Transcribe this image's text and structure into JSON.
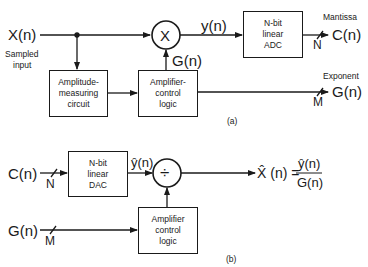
{
  "diagram_a": {
    "caption": "(a)",
    "input_label": "X(n)",
    "input_desc": [
      "Sampled",
      "input"
    ],
    "multiplier_symbol": "X",
    "y_label": "y(n)",
    "gain_label": "G(n)",
    "amplitude_box": [
      "Amplitude-",
      "measuring",
      "circuit"
    ],
    "amp_control_box": [
      "Amplifier-",
      "control",
      "logic"
    ],
    "adc_box": [
      "N-bit",
      "linear",
      "ADC"
    ],
    "mantissa_label": "Mantissa",
    "mantissa_output": "C(n)",
    "mantissa_bits": "N",
    "exponent_label": "Exponent",
    "exponent_output": "G(n)",
    "exponent_bits": "M"
  },
  "diagram_b": {
    "caption": "(b)",
    "c_input": "C(n)",
    "c_bits": "N",
    "g_input": "G(n)",
    "g_bits": "M",
    "dac_box": [
      "N-bit",
      "linear",
      "DAC"
    ],
    "yhat_label": "ŷ(n)",
    "divider_symbol": "÷",
    "amp_control_box": [
      "Amplifier",
      "control",
      "logic"
    ],
    "output_lhs": "X̂ (n) =",
    "output_numerator": "ŷ(n)",
    "output_denominator": "G(n)"
  }
}
